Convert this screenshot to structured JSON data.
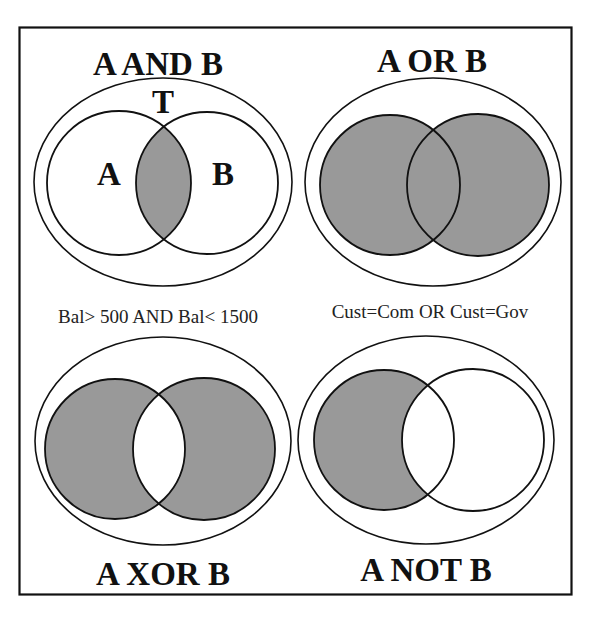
{
  "figure": {
    "fill_color": "#999999",
    "line_color": "#111111",
    "panels": [
      {
        "id": "and",
        "title": "A AND B",
        "shaded_region": "A ∩ B",
        "labels": {
          "universe": "T",
          "set_a": "A",
          "set_b": "B"
        },
        "caption": "Bal> 500 AND Bal< 1500"
      },
      {
        "id": "or",
        "title": "A OR B",
        "shaded_region": "A ∪ B",
        "caption": "Cust=Com OR Cust=Gov"
      },
      {
        "id": "xor",
        "title": "A XOR B",
        "shaded_region": "(A ∪ B) − (A ∩ B)"
      },
      {
        "id": "not",
        "title": "A NOT B",
        "shaded_region": "A − B"
      }
    ]
  }
}
